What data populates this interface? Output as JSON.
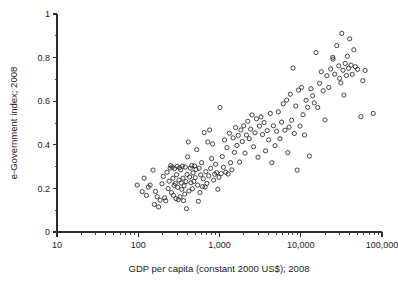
{
  "chart_data": {
    "type": "scatter",
    "title": "",
    "xlabel": "GDP per capita (constant 2000 US$); 2008",
    "ylabel": "e-Government index; 2008",
    "xscale": "log",
    "yscale": "linear",
    "xlim": [
      10,
      100000
    ],
    "ylim": [
      0,
      1
    ],
    "grid": false,
    "legend": null,
    "xticks": [
      10,
      100,
      1000,
      10000,
      100000
    ],
    "xtick_labels": [
      "10",
      "100",
      "1,000",
      "10,000",
      "100,000"
    ],
    "x_minor_ticks_per_decade": [
      2,
      3,
      4,
      5,
      6,
      7,
      8,
      9
    ],
    "yticks": [
      0,
      0.2,
      0.4,
      0.6,
      0.8,
      1
    ],
    "ytick_labels": [
      "0",
      "0.2",
      "0.4",
      "0.6",
      "0.8",
      "1"
    ],
    "y_minor_ticks": [
      0.1,
      0.3,
      0.5,
      0.7,
      0.9
    ],
    "marker": "open-circle",
    "marker_size_px": 4.2,
    "marker_color": "#2f2f2f",
    "n_points": 184,
    "points": [
      [
        97,
        0.215
      ],
      [
        112,
        0.185
      ],
      [
        118,
        0.247
      ],
      [
        126,
        0.168
      ],
      [
        133,
        0.206
      ],
      [
        140,
        0.215
      ],
      [
        152,
        0.284
      ],
      [
        158,
        0.126
      ],
      [
        163,
        0.186
      ],
      [
        171,
        0.162
      ],
      [
        178,
        0.115
      ],
      [
        186,
        0.146
      ],
      [
        196,
        0.221
      ],
      [
        203,
        0.255
      ],
      [
        211,
        0.157
      ],
      [
        218,
        0.143
      ],
      [
        226,
        0.274
      ],
      [
        233,
        0.199
      ],
      [
        240,
        0.233
      ],
      [
        247,
        0.293
      ],
      [
        251,
        0.305
      ],
      [
        256,
        0.181
      ],
      [
        262,
        0.298
      ],
      [
        267,
        0.247
      ],
      [
        271,
        0.168
      ],
      [
        276,
        0.214
      ],
      [
        281,
        0.291
      ],
      [
        286,
        0.222
      ],
      [
        291,
        0.153
      ],
      [
        296,
        0.263
      ],
      [
        301,
        0.301
      ],
      [
        306,
        0.205
      ],
      [
        311,
        0.148
      ],
      [
        317,
        0.238
      ],
      [
        322,
        0.295
      ],
      [
        327,
        0.161
      ],
      [
        333,
        0.286
      ],
      [
        338,
        0.225
      ],
      [
        343,
        0.196
      ],
      [
        349,
        0.302
      ],
      [
        355,
        0.247
      ],
      [
        361,
        0.144
      ],
      [
        367,
        0.212
      ],
      [
        373,
        0.174
      ],
      [
        379,
        0.298
      ],
      [
        386,
        0.231
      ],
      [
        392,
        0.107
      ],
      [
        399,
        0.264
      ],
      [
        406,
        0.345
      ],
      [
        413,
        0.413
      ],
      [
        421,
        0.188
      ],
      [
        429,
        0.252
      ],
      [
        437,
        0.293
      ],
      [
        446,
        0.226
      ],
      [
        455,
        0.305
      ],
      [
        464,
        0.198
      ],
      [
        473,
        0.271
      ],
      [
        483,
        0.232
      ],
      [
        493,
        0.303
      ],
      [
        503,
        0.249
      ],
      [
        514,
        0.287
      ],
      [
        525,
        0.378
      ],
      [
        537,
        0.215
      ],
      [
        549,
        0.141
      ],
      [
        561,
        0.293
      ],
      [
        574,
        0.181
      ],
      [
        588,
        0.262
      ],
      [
        602,
        0.318
      ],
      [
        617,
        0.208
      ],
      [
        632,
        0.244
      ],
      [
        648,
        0.456
      ],
      [
        664,
        0.207
      ],
      [
        681,
        0.277
      ],
      [
        699,
        0.223
      ],
      [
        718,
        0.413
      ],
      [
        737,
        0.257
      ],
      [
        757,
        0.468
      ],
      [
        778,
        0.292
      ],
      [
        800,
        0.337
      ],
      [
        823,
        0.404
      ],
      [
        847,
        0.238
      ],
      [
        872,
        0.265
      ],
      [
        898,
        0.311
      ],
      [
        925,
        0.272
      ],
      [
        954,
        0.196
      ],
      [
        984,
        0.251
      ],
      [
        1015,
        0.571
      ],
      [
        1048,
        0.268
      ],
      [
        1082,
        0.346
      ],
      [
        1118,
        0.297
      ],
      [
        1155,
        0.422
      ],
      [
        1194,
        0.274
      ],
      [
        1235,
        0.387
      ],
      [
        1278,
        0.266
      ],
      [
        1323,
        0.453
      ],
      [
        1370,
        0.318
      ],
      [
        1419,
        0.285
      ],
      [
        1471,
        0.432
      ],
      [
        1525,
        0.365
      ],
      [
        1581,
        0.479
      ],
      [
        1640,
        0.397
      ],
      [
        1702,
        0.443
      ],
      [
        1767,
        0.321
      ],
      [
        1835,
        0.468
      ],
      [
        1907,
        0.415
      ],
      [
        1982,
        0.487
      ],
      [
        2061,
        0.362
      ],
      [
        2144,
        0.445
      ],
      [
        2231,
        0.508
      ],
      [
        2322,
        0.428
      ],
      [
        2418,
        0.472
      ],
      [
        2519,
        0.537
      ],
      [
        2625,
        0.391
      ],
      [
        2736,
        0.455
      ],
      [
        2853,
        0.519
      ],
      [
        2976,
        0.343
      ],
      [
        3105,
        0.486
      ],
      [
        3241,
        0.528
      ],
      [
        3384,
        0.447
      ],
      [
        3534,
        0.502
      ],
      [
        3692,
        0.372
      ],
      [
        3858,
        0.465
      ],
      [
        4033,
        0.423
      ],
      [
        4217,
        0.544
      ],
      [
        4411,
        0.318
      ],
      [
        4615,
        0.487
      ],
      [
        4830,
        0.396
      ],
      [
        5057,
        0.462
      ],
      [
        5296,
        0.551
      ],
      [
        5548,
        0.428
      ],
      [
        5813,
        0.504
      ],
      [
        6093,
        0.588
      ],
      [
        6388,
        0.467
      ],
      [
        6699,
        0.605
      ],
      [
        6935,
        0.364
      ],
      [
        7184,
        0.481
      ],
      [
        7448,
        0.632
      ],
      [
        7727,
        0.513
      ],
      [
        8023,
        0.752
      ],
      [
        8336,
        0.452
      ],
      [
        8668,
        0.578
      ],
      [
        9020,
        0.284
      ],
      [
        9393,
        0.651
      ],
      [
        9789,
        0.486
      ],
      [
        10209,
        0.663
      ],
      [
        10655,
        0.538
      ],
      [
        11129,
        0.445
      ],
      [
        11632,
        0.604
      ],
      [
        12167,
        0.572
      ],
      [
        12737,
        0.348
      ],
      [
        13343,
        0.657
      ],
      [
        13988,
        0.625
      ],
      [
        14675,
        0.592
      ],
      [
        15407,
        0.823
      ],
      [
        16188,
        0.571
      ],
      [
        17021,
        0.682
      ],
      [
        17911,
        0.735
      ],
      [
        18862,
        0.648
      ],
      [
        19879,
        0.514
      ],
      [
        20968,
        0.717
      ],
      [
        22134,
        0.663
      ],
      [
        23385,
        0.748
      ],
      [
        24727,
        0.801
      ],
      [
        25000,
        0.793
      ],
      [
        26169,
        0.724
      ],
      [
        27722,
        0.855
      ],
      [
        29392,
        0.762
      ],
      [
        30000,
        0.705
      ],
      [
        31189,
        0.684
      ],
      [
        32000,
        0.911
      ],
      [
        33124,
        0.742
      ],
      [
        34000,
        0.628
      ],
      [
        35219,
        0.773
      ],
      [
        36500,
        0.718
      ],
      [
        37500,
        0.806
      ],
      [
        38800,
        0.751
      ],
      [
        40000,
        0.886
      ],
      [
        41500,
        0.765
      ],
      [
        43000,
        0.723
      ],
      [
        45000,
        0.836
      ],
      [
        47000,
        0.758
      ],
      [
        50000,
        0.746
      ],
      [
        55000,
        0.529
      ],
      [
        58000,
        0.694
      ],
      [
        62000,
        0.741
      ],
      [
        78000,
        0.544
      ]
    ]
  },
  "axes": {
    "x_title": "GDP per capita (constant 2000 US$); 2008",
    "y_title": "e-Government index; 2008"
  }
}
